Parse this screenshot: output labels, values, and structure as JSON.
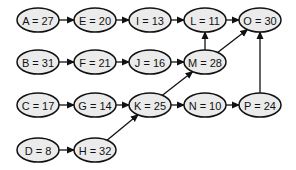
{
  "diagram": {
    "type": "directed-graph",
    "node_style": {
      "fill": "#ebebeb",
      "stroke": "#111111",
      "rx": 21,
      "ry": 12
    },
    "nodes": [
      {
        "id": "A",
        "label": "A = 27",
        "value": 27,
        "x": 38,
        "y": 20
      },
      {
        "id": "E",
        "label": "E = 20",
        "value": 20,
        "x": 95,
        "y": 20
      },
      {
        "id": "I",
        "label": "I = 13",
        "value": 13,
        "x": 150,
        "y": 20
      },
      {
        "id": "L",
        "label": "L = 11",
        "value": 11,
        "x": 205,
        "y": 20
      },
      {
        "id": "O",
        "label": "O = 30",
        "value": 30,
        "x": 260,
        "y": 20
      },
      {
        "id": "B",
        "label": "B = 31",
        "value": 31,
        "x": 38,
        "y": 62
      },
      {
        "id": "F",
        "label": "F = 21",
        "value": 21,
        "x": 95,
        "y": 62
      },
      {
        "id": "J",
        "label": "J = 16",
        "value": 16,
        "x": 150,
        "y": 62
      },
      {
        "id": "M",
        "label": "M = 28",
        "value": 28,
        "x": 205,
        "y": 62
      },
      {
        "id": "C",
        "label": "C = 17",
        "value": 17,
        "x": 38,
        "y": 105
      },
      {
        "id": "G",
        "label": "G = 14",
        "value": 14,
        "x": 95,
        "y": 105
      },
      {
        "id": "K",
        "label": "K = 25",
        "value": 25,
        "x": 150,
        "y": 105
      },
      {
        "id": "N",
        "label": "N = 10",
        "value": 10,
        "x": 205,
        "y": 105
      },
      {
        "id": "P",
        "label": "P = 24",
        "value": 24,
        "x": 260,
        "y": 105
      },
      {
        "id": "D",
        "label": "D = 8",
        "value": 8,
        "x": 38,
        "y": 150
      },
      {
        "id": "H",
        "label": "H = 32",
        "value": 32,
        "x": 95,
        "y": 150
      }
    ],
    "edges": [
      {
        "from": "A",
        "to": "E"
      },
      {
        "from": "E",
        "to": "I"
      },
      {
        "from": "I",
        "to": "L"
      },
      {
        "from": "L",
        "to": "O"
      },
      {
        "from": "B",
        "to": "F"
      },
      {
        "from": "F",
        "to": "J"
      },
      {
        "from": "J",
        "to": "M"
      },
      {
        "from": "M",
        "to": "L"
      },
      {
        "from": "M",
        "to": "O"
      },
      {
        "from": "C",
        "to": "G"
      },
      {
        "from": "G",
        "to": "K"
      },
      {
        "from": "K",
        "to": "M"
      },
      {
        "from": "K",
        "to": "N"
      },
      {
        "from": "N",
        "to": "P"
      },
      {
        "from": "P",
        "to": "O"
      },
      {
        "from": "D",
        "to": "H"
      },
      {
        "from": "H",
        "to": "K"
      }
    ]
  }
}
